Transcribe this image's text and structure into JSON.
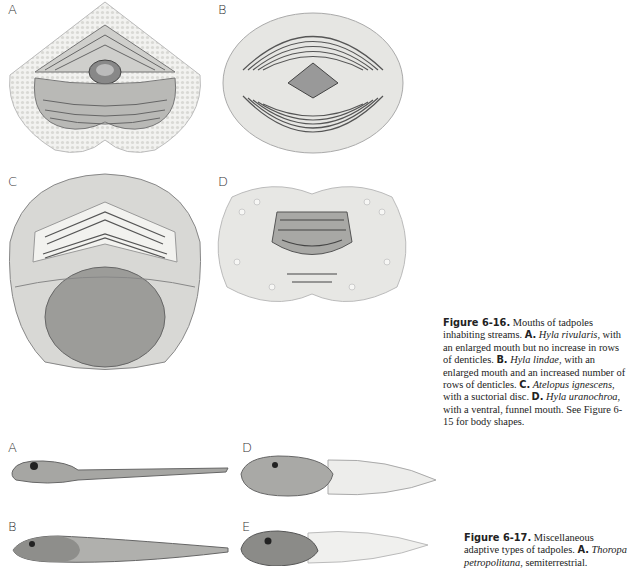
{
  "figure_6_16": {
    "panels": [
      {
        "letter": "A",
        "subject": "mouth-hyla-rivularis"
      },
      {
        "letter": "B",
        "subject": "mouth-hyla-lindae"
      },
      {
        "letter": "C",
        "subject": "mouth-atelopus-ignescens"
      },
      {
        "letter": "D",
        "subject": "mouth-hyla-uranochroa"
      }
    ],
    "caption": {
      "figure_label": "Figure 6-16.",
      "intro": " Mouths of tadpoles inhabiting streams. ",
      "items": [
        {
          "letter": "A.",
          "species": "Hyla rivularis",
          "text": ", with an enlarged mouth but no increase in rows of denticles. "
        },
        {
          "letter": "B.",
          "species": "Hyla lindae",
          "text": ", with an enlarged mouth and an increased number of rows of denticles. "
        },
        {
          "letter": "C.",
          "species": "Atelopus ignescens",
          "text": ", with a suctorial disc. "
        },
        {
          "letter": "D.",
          "species": "Hyla uranochroa",
          "text": ", with a ventral, funnel mouth. See Figure 6-15 for body shapes."
        }
      ]
    }
  },
  "figure_6_17": {
    "panels": [
      {
        "letter": "A",
        "subject": "tadpole-slender"
      },
      {
        "letter": "B",
        "subject": "tadpole-long"
      },
      {
        "letter": "D",
        "subject": "tadpole-deep-fin"
      },
      {
        "letter": "E",
        "subject": "tadpole-high-fin"
      }
    ],
    "caption": {
      "figure_label": "Figure 6-17.",
      "intro": " Miscellaneous adaptive types of tadpoles. ",
      "items": [
        {
          "letter": "A.",
          "species": "Thoropa petropolitana",
          "text": ", semiterrestrial."
        }
      ]
    }
  }
}
